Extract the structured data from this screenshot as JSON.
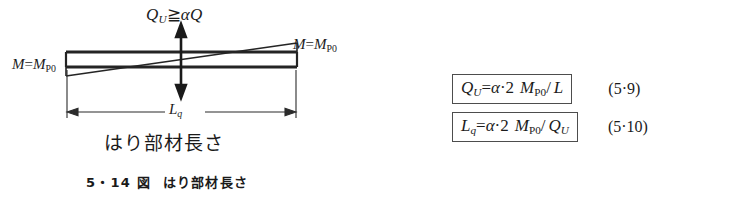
{
  "figure": {
    "shear_label": {
      "symbol": "Q",
      "subscript": "U",
      "relation": "≧",
      "right": "αQ"
    },
    "moment_left": {
      "lhs": "M",
      "equals": "=",
      "rhs": "M",
      "rhs_sub": "P0"
    },
    "moment_right": {
      "lhs": "M",
      "equals": "=",
      "rhs": "M",
      "rhs_sub": "P0"
    },
    "dimension_label": {
      "symbol": "L",
      "subscript": "q"
    },
    "member_length_text": "はり部材長さ",
    "caption_number": "5・14 図",
    "caption_text": "はり部材長さ",
    "colors": {
      "ink": "#1a1a1a",
      "line": "#262626",
      "background": "#ffffff"
    }
  },
  "equations": [
    {
      "id": "eq-5-9",
      "lhs": "Q",
      "lhs_sub": "U",
      "equals": "=",
      "alpha": "α",
      "dot": "·",
      "coefficient": "2",
      "moment": "M",
      "moment_sub": "P0",
      "slash": "/",
      "denominator": "L",
      "denominator_sub": "",
      "number": "(5·9)"
    },
    {
      "id": "eq-5-10",
      "lhs": "L",
      "lhs_sub": "q",
      "equals": "=",
      "alpha": "α",
      "dot": "·",
      "coefficient": "2",
      "moment": "M",
      "moment_sub": "P0",
      "slash": "/",
      "denominator": "Q",
      "denominator_sub": "U",
      "number": "(5·10)"
    }
  ]
}
